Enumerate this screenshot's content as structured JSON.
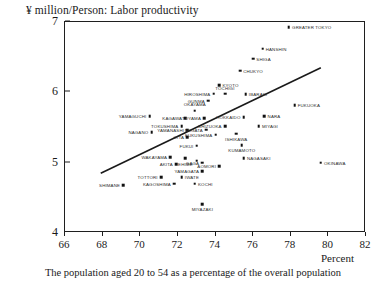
{
  "chart_data": {
    "type": "scatter",
    "title": "¥ million/Person: Labor productivity",
    "xlabel": "Percent",
    "ylabel": "",
    "caption": "The population aged 20 to 54 as a percentage of the overall population",
    "xlim": [
      66,
      82
    ],
    "ylim": [
      4,
      7
    ],
    "xticks": [
      66,
      68,
      70,
      72,
      74,
      76,
      78,
      80,
      82
    ],
    "yticks": [
      4,
      5,
      6,
      7
    ],
    "grid": false,
    "legend": null,
    "trend_line": {
      "label": "regression line",
      "x0": 67.9,
      "y0": 4.85,
      "x1": 79.6,
      "y1": 6.35
    },
    "points": [
      {
        "label": "GREATER TOKYO",
        "x": 77.9,
        "y": 6.93,
        "anchor": "right"
      },
      {
        "label": "HANSHIN",
        "x": 76.5,
        "y": 6.62,
        "anchor": "right"
      },
      {
        "label": "SHIGA",
        "x": 76.0,
        "y": 6.48,
        "anchor": "right"
      },
      {
        "label": "CHUKYO",
        "x": 75.3,
        "y": 6.31,
        "anchor": "right"
      },
      {
        "label": "KYOTO",
        "x": 74.2,
        "y": 6.1,
        "anchor": "right"
      },
      {
        "label": "TOCHIGI",
        "x": 74.5,
        "y": 5.98,
        "anchor": "above"
      },
      {
        "label": "IBARAKI",
        "x": 75.6,
        "y": 5.97,
        "anchor": "right"
      },
      {
        "label": "HIROSHIMA",
        "x": 73.9,
        "y": 5.98,
        "anchor": "left"
      },
      {
        "label": "GUNMA",
        "x": 73.6,
        "y": 5.88,
        "anchor": "left"
      },
      {
        "label": "FUKUOKA",
        "x": 78.2,
        "y": 5.82,
        "anchor": "right"
      },
      {
        "label": "OKAYAMA",
        "x": 72.9,
        "y": 5.74,
        "anchor": "above"
      },
      {
        "label": "KAGAWA",
        "x": 72.4,
        "y": 5.63,
        "anchor": "left"
      },
      {
        "label": "TOYAMA",
        "x": 73.4,
        "y": 5.63,
        "anchor": "left"
      },
      {
        "label": "HOKKAIDO",
        "x": 75.5,
        "y": 5.65,
        "anchor": "left"
      },
      {
        "label": "NARA",
        "x": 76.6,
        "y": 5.66,
        "anchor": "right"
      },
      {
        "label": "YAMAGUCHI",
        "x": 70.5,
        "y": 5.66,
        "anchor": "left"
      },
      {
        "label": "TOKUSHIMA",
        "x": 72.2,
        "y": 5.52,
        "anchor": "left"
      },
      {
        "label": "YAMANASHI",
        "x": 72.5,
        "y": 5.46,
        "anchor": "left"
      },
      {
        "label": "NIIGATA",
        "x": 73.5,
        "y": 5.47,
        "anchor": "left"
      },
      {
        "label": "SHIZUOKA",
        "x": 74.5,
        "y": 5.52,
        "anchor": "left"
      },
      {
        "label": "MIYAGI",
        "x": 76.3,
        "y": 5.52,
        "anchor": "right"
      },
      {
        "label": "NAGANO",
        "x": 70.6,
        "y": 5.43,
        "anchor": "left"
      },
      {
        "label": "OITA",
        "x": 72.5,
        "y": 5.36,
        "anchor": "left"
      },
      {
        "label": "FUKUSHIMA",
        "x": 74.0,
        "y": 5.4,
        "anchor": "left"
      },
      {
        "label": "ISHIKAWA",
        "x": 75.1,
        "y": 5.41,
        "anchor": "below"
      },
      {
        "label": "FUKUI",
        "x": 73.0,
        "y": 5.24,
        "anchor": "left"
      },
      {
        "label": "KUMAMOTO",
        "x": 75.4,
        "y": 5.25,
        "anchor": "below"
      },
      {
        "label": "WAKAYAMA",
        "x": 71.6,
        "y": 5.08,
        "anchor": "left"
      },
      {
        "label": "EHIME",
        "x": 72.4,
        "y": 5.06,
        "anchor": "below"
      },
      {
        "label": "NAGASAKI",
        "x": 75.5,
        "y": 5.06,
        "anchor": "right"
      },
      {
        "label": "AKITA",
        "x": 71.9,
        "y": 4.98,
        "anchor": "left"
      },
      {
        "label": "SAGA",
        "x": 73.3,
        "y": 5.0,
        "anchor": "left"
      },
      {
        "label": "SAGA2",
        "x": 73.0,
        "y": 5.03,
        "anchor": "hidden"
      },
      {
        "label": "AOMORI",
        "x": 74.2,
        "y": 4.95,
        "anchor": "left"
      },
      {
        "label": "YAMAGATA",
        "x": 73.3,
        "y": 4.88,
        "anchor": "left"
      },
      {
        "label": "OKINAWA",
        "x": 79.6,
        "y": 5.0,
        "anchor": "right"
      },
      {
        "label": "TOTTORI",
        "x": 71.1,
        "y": 4.79,
        "anchor": "left"
      },
      {
        "label": "IWATE",
        "x": 72.2,
        "y": 4.79,
        "anchor": "right"
      },
      {
        "label": "KAGOSHIMA",
        "x": 71.8,
        "y": 4.7,
        "anchor": "left"
      },
      {
        "label": "KOCHI",
        "x": 72.9,
        "y": 4.7,
        "anchor": "right"
      },
      {
        "label": "SHIMANE",
        "x": 69.1,
        "y": 4.68,
        "anchor": "left"
      },
      {
        "label": "MIYAZAKI",
        "x": 73.3,
        "y": 4.41,
        "anchor": "below"
      }
    ]
  }
}
